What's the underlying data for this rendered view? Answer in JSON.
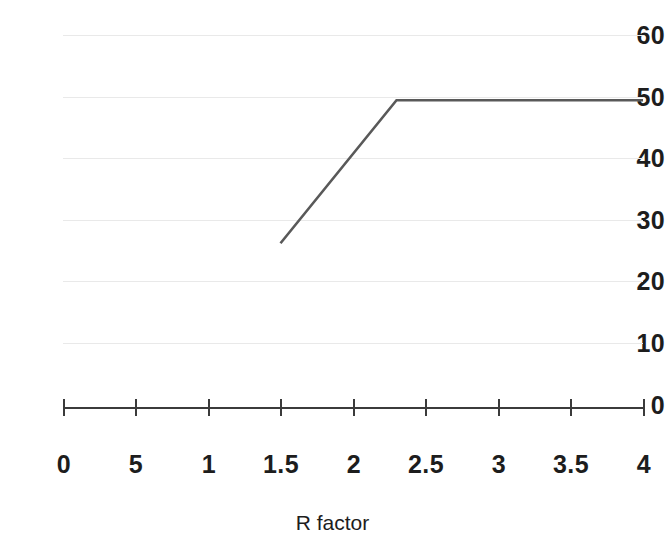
{
  "chart_data": {
    "type": "line",
    "title": "",
    "xlabel": "R factor",
    "ylabel": "",
    "xlim": [
      0,
      4
    ],
    "ylim": [
      0,
      60
    ],
    "grid": true,
    "legend": null,
    "y_ticks": [
      {
        "label": "60",
        "value": 60
      },
      {
        "label": "50",
        "value": 50
      },
      {
        "label": "40",
        "value": 40
      },
      {
        "label": "30",
        "value": 30
      },
      {
        "label": "20",
        "value": 20
      },
      {
        "label": "10",
        "value": 10
      },
      {
        "label": "0",
        "value": 0
      }
    ],
    "x_ticks": [
      {
        "label": "0",
        "value": 0
      },
      {
        "label": "5",
        "value": 0.5
      },
      {
        "label": "1",
        "value": 1
      },
      {
        "label": "1.5",
        "value": 1.5
      },
      {
        "label": "2",
        "value": 2
      },
      {
        "label": "2.5",
        "value": 2.5
      },
      {
        "label": "3",
        "value": 3
      },
      {
        "label": "3.5",
        "value": 3.5
      },
      {
        "label": "4",
        "value": 4
      }
    ],
    "series": [
      {
        "name": "series-1",
        "color": "#595959",
        "points": [
          {
            "x": 1.5,
            "y": 26.5
          },
          {
            "x": 2.3,
            "y": 49.5
          },
          {
            "x": 4.0,
            "y": 49.5
          }
        ]
      }
    ]
  },
  "style": {
    "axis_color": "#3b3b3b",
    "grid_color": "#e9e9e9",
    "line_color": "#595959",
    "text_color": "#1d1d1d",
    "background": "#ffffff"
  }
}
